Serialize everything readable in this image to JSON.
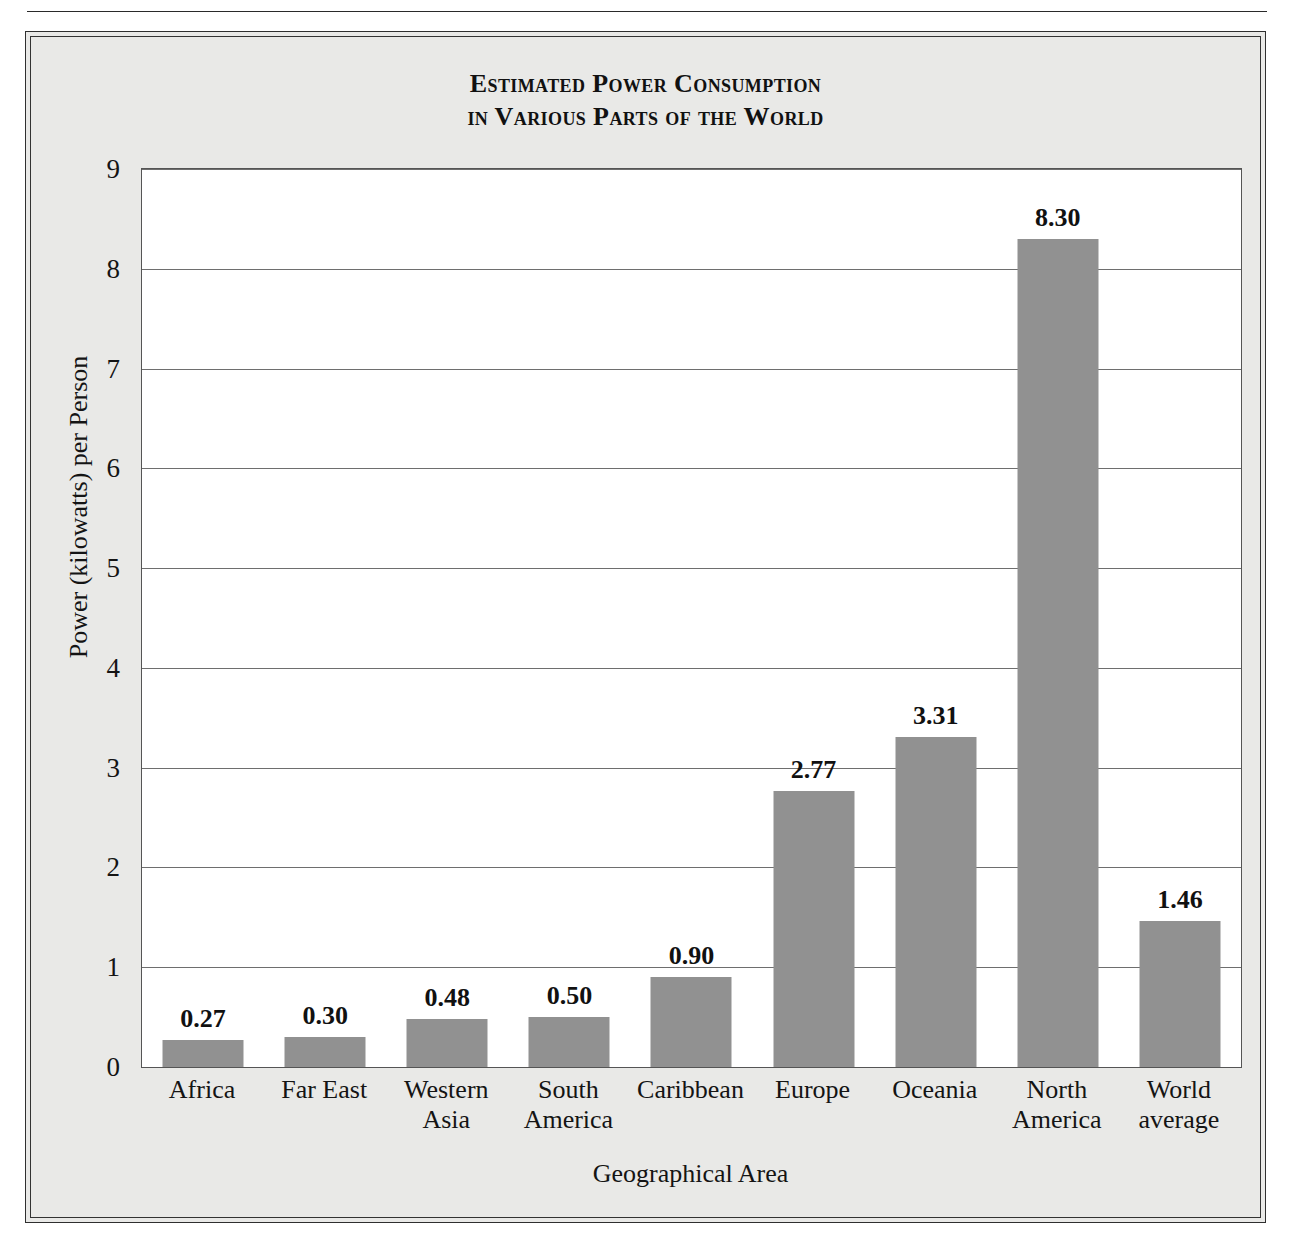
{
  "chart_data": {
    "type": "bar",
    "title": "Estimated Power Consumption in Various Parts of the World",
    "title_line1": "Estimated Power Consumption",
    "title_line2": "in Various Parts of the World",
    "xlabel": "Geographical Area",
    "ylabel": "Power (kilowatts) per Person",
    "ylim": [
      0,
      9
    ],
    "yticks": [
      "0",
      "1",
      "2",
      "3",
      "4",
      "5",
      "6",
      "7",
      "8",
      "9"
    ],
    "grid": true,
    "legend": "none",
    "bar_color": "#919191",
    "categories": [
      "Africa",
      "Far East",
      "Western Asia",
      "South America",
      "Caribbean",
      "Europe",
      "Oceania",
      "North America",
      "World average"
    ],
    "category_lines": [
      [
        "Africa"
      ],
      [
        "Far East"
      ],
      [
        "Western",
        "Asia"
      ],
      [
        "South",
        "America"
      ],
      [
        "Caribbean"
      ],
      [
        "Europe"
      ],
      [
        "Oceania"
      ],
      [
        "North",
        "America"
      ],
      [
        "World",
        "average"
      ]
    ],
    "values": [
      0.27,
      0.3,
      0.48,
      0.5,
      0.9,
      2.77,
      3.31,
      8.3,
      1.46
    ],
    "value_labels": [
      "0.27",
      "0.30",
      "0.48",
      "0.50",
      "0.90",
      "2.77",
      "3.31",
      "8.30",
      "1.46"
    ]
  }
}
